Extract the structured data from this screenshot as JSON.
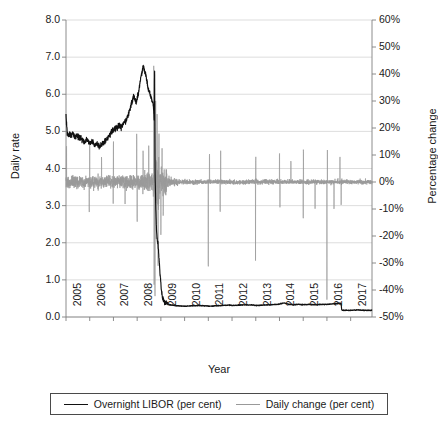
{
  "chart_data": {
    "type": "line",
    "title": "",
    "xlabel": "Year",
    "ylabel": "Daily rate",
    "y2label": "Percentage change",
    "xlim": [
      2005,
      2017.9
    ],
    "ylim": [
      0.0,
      8.0
    ],
    "y2lim": [
      -50,
      60
    ],
    "grid": true,
    "legend_position": "bottom",
    "xticks": [
      "2005",
      "2006",
      "2007",
      "2008",
      "2009",
      "2010",
      "2011",
      "2012",
      "2013",
      "2014",
      "2015",
      "2016",
      "2017"
    ],
    "yticks_left": [
      "0.0",
      "1.0",
      "2.0",
      "3.0",
      "4.0",
      "5.0",
      "6.0",
      "7.0",
      "8.0"
    ],
    "yticks_right": [
      "-50%",
      "-40%",
      "-30%",
      "-20%",
      "-10%",
      "0%",
      "10%",
      "20%",
      "30%",
      "40%",
      "50%",
      "60%"
    ],
    "colors": {
      "libor": "#111111",
      "daily_change": "#999999",
      "grid": "#d9d9d9",
      "axis": "#808080"
    },
    "series": [
      {
        "name": "Overnight LIBOR (per cent)",
        "axis": "left",
        "color": "#111111",
        "x": [
          2005.0,
          2005.05,
          2005.1,
          2005.16,
          2005.22,
          2005.3,
          2005.38,
          2005.46,
          2005.55,
          2005.64,
          2005.72,
          2005.8,
          2005.88,
          2005.96,
          2006.04,
          2006.12,
          2006.2,
          2006.28,
          2006.36,
          2006.44,
          2006.52,
          2006.6,
          2006.68,
          2006.76,
          2006.84,
          2006.92,
          2007.0,
          2007.08,
          2007.16,
          2007.24,
          2007.32,
          2007.4,
          2007.48,
          2007.54,
          2007.6,
          2007.66,
          2007.72,
          2007.78,
          2007.84,
          2007.9,
          2007.96,
          2008.02,
          2008.08,
          2008.14,
          2008.2,
          2008.26,
          2008.32,
          2008.38,
          2008.44,
          2008.5,
          2008.56,
          2008.62,
          2008.66,
          2008.7,
          2008.72,
          2008.735,
          2008.745,
          2008.755,
          2008.77,
          2008.79,
          2008.82,
          2008.85,
          2008.88,
          2008.92,
          2008.96,
          2009.0,
          2009.04,
          2009.08,
          2009.14,
          2009.22,
          2009.32,
          2009.45,
          2009.6,
          2009.8,
          2010.0,
          2010.3,
          2010.6,
          2010.9,
          2011.0,
          2011.3,
          2011.6,
          2011.9,
          2012.0,
          2012.3,
          2012.6,
          2012.9,
          2013.0,
          2013.3,
          2013.6,
          2013.9,
          2014.0,
          2014.2,
          2014.4,
          2014.6,
          2014.8,
          2015.0,
          2015.25,
          2015.5,
          2015.75,
          2016.0,
          2016.2,
          2016.4,
          2016.55,
          2016.6,
          2016.62,
          2016.65,
          2016.8,
          2017.0,
          2017.3,
          2017.6,
          2017.85
        ],
        "y": [
          5.45,
          4.95,
          4.9,
          4.92,
          4.88,
          4.95,
          4.86,
          4.9,
          4.84,
          4.8,
          4.74,
          4.7,
          4.8,
          4.72,
          4.68,
          4.7,
          4.64,
          4.66,
          4.62,
          4.6,
          4.66,
          4.7,
          4.78,
          4.82,
          4.9,
          4.98,
          5.02,
          5.1,
          5.08,
          5.16,
          5.12,
          5.2,
          5.24,
          5.3,
          5.4,
          5.52,
          5.66,
          5.8,
          5.95,
          5.86,
          5.78,
          5.94,
          6.12,
          6.4,
          6.6,
          6.78,
          6.62,
          6.48,
          6.2,
          6.1,
          5.95,
          5.84,
          5.78,
          5.6,
          5.2,
          6.8,
          5.1,
          3.9,
          3.4,
          2.8,
          2.3,
          2.05,
          1.95,
          1.6,
          1.2,
          0.9,
          0.62,
          0.48,
          0.42,
          0.38,
          0.34,
          0.32,
          0.31,
          0.3,
          0.29,
          0.3,
          0.31,
          0.3,
          0.29,
          0.3,
          0.31,
          0.32,
          0.31,
          0.32,
          0.33,
          0.32,
          0.31,
          0.32,
          0.33,
          0.34,
          0.35,
          0.38,
          0.34,
          0.33,
          0.34,
          0.33,
          0.34,
          0.33,
          0.34,
          0.34,
          0.35,
          0.36,
          0.37,
          0.36,
          0.2,
          0.18,
          0.18,
          0.18,
          0.19,
          0.18,
          0.18
        ]
      },
      {
        "name": "Daily change (per cent)",
        "axis": "right",
        "color": "#999999",
        "note": "High-frequency daily percentage change oscillating about 0%, with dense volatility 2005-2009 (roughly ±10%), extreme swings around the 2008-2009 crisis (to about +45% and -45%), and low volatility thereafter with isolated spikes in 2011, 2013, 2014, 2015 and 2016."
      }
    ]
  },
  "axes": {
    "left_title": "Daily rate",
    "right_title": "Percentage change",
    "x_title": "Year"
  },
  "legend": {
    "items": [
      {
        "label": "Overnight LIBOR (per cent)",
        "color": "#111111"
      },
      {
        "label": "Daily change (per cent)",
        "color": "#999999"
      }
    ]
  }
}
